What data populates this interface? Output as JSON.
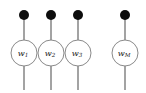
{
  "figure": {
    "name": "matrix-product-operator-wire-diagram",
    "background_color": "#ffffff",
    "width": 146,
    "height": 93,
    "wire_color": "#8c8c8c",
    "dot_color": "#0d0d0d",
    "circle_fill": "#ffffff",
    "circle_stroke": "#8a8a8a"
  },
  "columns": [
    {
      "id": "column-1",
      "label_base": "w",
      "label_sub": "1",
      "center_x": 24,
      "dot_y": 15,
      "dot_radius": 5,
      "circle_y": 53,
      "circle_radius": 13,
      "wire_top": 15,
      "wire_bottom": 90
    },
    {
      "id": "column-2",
      "label_base": "w",
      "label_sub": "2",
      "center_x": 51,
      "dot_y": 15,
      "dot_radius": 5,
      "circle_y": 53,
      "circle_radius": 13,
      "wire_top": 15,
      "wire_bottom": 90
    },
    {
      "id": "column-3",
      "label_base": "w",
      "label_sub": "3",
      "center_x": 78,
      "dot_y": 15,
      "dot_radius": 5,
      "circle_y": 53,
      "circle_radius": 13,
      "wire_top": 15,
      "wire_bottom": 90
    },
    {
      "id": "column-m",
      "label_base": "w",
      "label_sub": "M",
      "center_x": 125,
      "dot_y": 15,
      "dot_radius": 5,
      "circle_y": 53,
      "circle_radius": 13,
      "wire_top": 15,
      "wire_bottom": 90
    }
  ]
}
